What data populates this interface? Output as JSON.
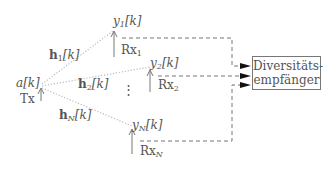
{
  "diagram": {
    "transmitter": {
      "signal": "a[k]",
      "label": "Tx"
    },
    "channels": [
      {
        "name": "h",
        "index": "1",
        "arg": "[k]"
      },
      {
        "name": "h",
        "index": "2",
        "arg": "[k]"
      },
      {
        "name": "h",
        "index": "N",
        "arg": "[k]"
      }
    ],
    "receivers": [
      {
        "signal_name": "y",
        "index": "1",
        "arg": "[k]",
        "label": "Rx",
        "label_index": "1"
      },
      {
        "signal_name": "y",
        "index": "2",
        "arg": "[k]",
        "label": "Rx",
        "label_index": "2"
      },
      {
        "signal_name": "y",
        "index": "N",
        "arg": "[k]",
        "label": "Rx",
        "label_index": "N"
      }
    ],
    "ellipsis": "⋮",
    "combiner": {
      "line1": "Diversitäts-",
      "line2": "empfänger"
    },
    "colors": {
      "line": "#777777",
      "dotted": "#bbbbbb",
      "arrowhead": "#111111"
    }
  }
}
